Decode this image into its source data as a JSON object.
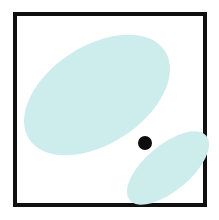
{
  "figure": {
    "title": "Two overlapping-region ellipse diagram with point marker",
    "width": 219,
    "height": 220,
    "background_color": "#ffffff",
    "frame": {
      "label": "figure-border",
      "stroke_color": "#101010",
      "stroke_width": 4,
      "x": 13,
      "y": 12,
      "width": 194,
      "height": 195,
      "fill_color": "#ffffff"
    },
    "shapes": [
      {
        "id": "large-ellipse",
        "label": "large-ellipse",
        "type": "ellipse",
        "center_x": 97,
        "center_y": 95,
        "radius_x": 81,
        "radius_y": 49,
        "rotation_deg": -33,
        "fill_color": "#cdecec",
        "stroke_color": "none"
      },
      {
        "id": "small-ellipse",
        "label": "small-ellipse",
        "type": "ellipse",
        "center_x": 168,
        "center_y": 168,
        "radius_x": 50,
        "radius_y": 23,
        "rotation_deg": -40,
        "fill_color": "#cdecec",
        "stroke_color": "none"
      },
      {
        "id": "point-marker",
        "label": "point-marker-dot",
        "type": "circle",
        "center_x": 145,
        "center_y": 143,
        "radius": 7,
        "fill_color": "#0d0d0d",
        "stroke_color": "none"
      }
    ],
    "colors": {
      "ellipse_fill": "#cdecec",
      "point_fill": "#0d0d0d",
      "frame_stroke": "#101010",
      "canvas": "#ffffff"
    }
  }
}
